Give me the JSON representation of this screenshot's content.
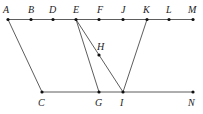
{
  "diagram": {
    "points": [
      {
        "id": "A",
        "x": 8,
        "y": 19.5,
        "lx": 3,
        "ly": 13,
        "dot": true
      },
      {
        "id": "B",
        "x": 31,
        "y": 19.5,
        "lx": 28,
        "ly": 13,
        "dot": true
      },
      {
        "id": "D",
        "x": 53,
        "y": 19.5,
        "lx": 49,
        "ly": 13,
        "dot": true
      },
      {
        "id": "E",
        "x": 76,
        "y": 19.5,
        "lx": 73,
        "ly": 13,
        "dot": true
      },
      {
        "id": "F",
        "x": 99,
        "y": 19.5,
        "lx": 97,
        "ly": 13,
        "dot": true
      },
      {
        "id": "J",
        "x": 123,
        "y": 19.5,
        "lx": 121,
        "ly": 13,
        "dot": true
      },
      {
        "id": "K",
        "x": 147,
        "y": 19.5,
        "lx": 143,
        "ly": 13,
        "dot": true
      },
      {
        "id": "L",
        "x": 169,
        "y": 19.5,
        "lx": 166,
        "ly": 13,
        "dot": true
      },
      {
        "id": "M",
        "x": 193,
        "y": 19.5,
        "lx": 188,
        "ly": 13,
        "dot": true
      },
      {
        "id": "H",
        "x": 99,
        "y": 55,
        "lx": 97,
        "ly": 50,
        "dot": true
      },
      {
        "id": "C",
        "x": 42,
        "y": 92,
        "lx": 38,
        "ly": 106,
        "dot": true
      },
      {
        "id": "G",
        "x": 99,
        "y": 92,
        "lx": 95,
        "ly": 106,
        "dot": true
      },
      {
        "id": "I",
        "x": 123,
        "y": 92,
        "lx": 120,
        "ly": 106,
        "dot": true
      },
      {
        "id": "N",
        "x": 193,
        "y": 92,
        "lx": 188,
        "ly": 106,
        "dot": true
      }
    ],
    "segments": [
      {
        "from": "A",
        "to": "M"
      },
      {
        "from": "C",
        "to": "N"
      },
      {
        "from": "A",
        "to": "C"
      },
      {
        "from": "E",
        "to": "G"
      },
      {
        "from": "E",
        "to": "I"
      },
      {
        "from": "K",
        "to": "I"
      }
    ],
    "colors": {
      "stroke": "#333333",
      "point": "#111111",
      "label": "#222222"
    }
  }
}
